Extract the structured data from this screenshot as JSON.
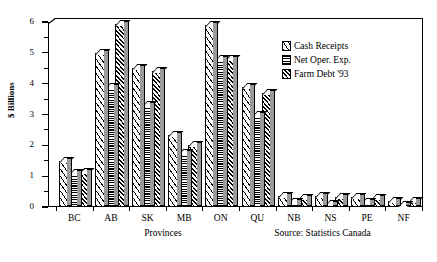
{
  "chart_data": {
    "type": "bar",
    "title": "",
    "xlabel": "Provinces",
    "ylabel": "$ Billions",
    "ylim": [
      0,
      6
    ],
    "yticks": [
      0,
      1,
      2,
      3,
      4,
      5,
      6
    ],
    "ytick_labels": [
      "0",
      "1",
      "2",
      "3",
      "4",
      "5",
      "6"
    ],
    "minor_tick_interval": 0.5,
    "grid": false,
    "legend_position": "upper right",
    "annotations": [
      "Source: Statistics Canada"
    ],
    "categories": [
      "BC",
      "AB",
      "SK",
      "MB",
      "ON",
      "QU",
      "NB",
      "NS",
      "PE",
      "NF"
    ],
    "series": [
      {
        "name": "Cash Receipts",
        "pattern": "sparse-diagonal-hatch",
        "values": [
          1.5,
          5.0,
          4.5,
          2.35,
          5.9,
          3.9,
          0.35,
          0.35,
          0.33,
          0.2
        ]
      },
      {
        "name": "Net Oper. Exp.",
        "pattern": "horizontal-lines",
        "values": [
          1.1,
          3.9,
          3.3,
          1.75,
          4.8,
          3.0,
          0.15,
          0.1,
          0.15,
          0.05
        ]
      },
      {
        "name": "Farm Debt '93",
        "pattern": "dense-diagonal-hatch",
        "values": [
          1.15,
          5.95,
          4.4,
          2.0,
          4.8,
          3.7,
          0.3,
          0.32,
          0.3,
          0.18
        ]
      }
    ]
  },
  "legend": {
    "items": [
      {
        "label": "Cash Receipts"
      },
      {
        "label": "Net Oper. Exp."
      },
      {
        "label": "Farm Debt '93"
      }
    ]
  },
  "axes": {
    "y_title": "$ Billions",
    "x_title": "Provinces"
  },
  "source": {
    "text": "Source: Statistics Canada"
  },
  "colors": {
    "ink": "#000000",
    "background": "#ffffff",
    "bar_side_shade": "#9a9a9a"
  }
}
